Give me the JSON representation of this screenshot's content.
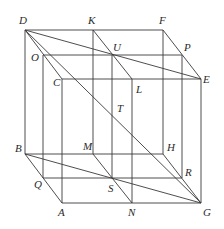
{
  "diagram": {
    "stroke_color": "#3a3a3a",
    "points": {
      "D": [
        25,
        30
      ],
      "K": [
        93,
        30
      ],
      "F": [
        163,
        30
      ],
      "O": [
        43,
        55
      ],
      "U": [
        112,
        55
      ],
      "P": [
        182,
        55
      ],
      "C": [
        62,
        79
      ],
      "L": [
        132,
        79
      ],
      "E": [
        201,
        79
      ],
      "B": [
        25,
        154
      ],
      "M": [
        93,
        154
      ],
      "H": [
        163,
        154
      ],
      "Q": [
        43,
        178
      ],
      "S": [
        112,
        178
      ],
      "R": [
        182,
        178
      ],
      "A": [
        62,
        203
      ],
      "N": [
        132,
        203
      ],
      "G": [
        201,
        203
      ],
      "T": [
        112,
        115
      ]
    },
    "segments": [
      [
        "D",
        "F"
      ],
      [
        "O",
        "P"
      ],
      [
        "C",
        "E"
      ],
      [
        "B",
        "H"
      ],
      [
        "Q",
        "R"
      ],
      [
        "A",
        "G"
      ],
      [
        "D",
        "B"
      ],
      [
        "K",
        "M"
      ],
      [
        "F",
        "H"
      ],
      [
        "O",
        "Q"
      ],
      [
        "U",
        "S"
      ],
      [
        "P",
        "R"
      ],
      [
        "C",
        "A"
      ],
      [
        "L",
        "N"
      ],
      [
        "E",
        "G"
      ],
      [
        "D",
        "C"
      ],
      [
        "K",
        "L"
      ],
      [
        "F",
        "E"
      ],
      [
        "B",
        "A"
      ],
      [
        "M",
        "N"
      ],
      [
        "H",
        "G"
      ],
      [
        "D",
        "E"
      ],
      [
        "D",
        "G"
      ],
      [
        "B",
        "G"
      ]
    ],
    "labels": [
      {
        "text": "D",
        "x": 19,
        "y": 24
      },
      {
        "text": "K",
        "x": 88,
        "y": 24
      },
      {
        "text": "F",
        "x": 159,
        "y": 24
      },
      {
        "text": "O",
        "x": 31,
        "y": 61
      },
      {
        "text": "U",
        "x": 113,
        "y": 51
      },
      {
        "text": "P",
        "x": 184,
        "y": 51
      },
      {
        "text": "C",
        "x": 53,
        "y": 86
      },
      {
        "text": "L",
        "x": 136,
        "y": 93
      },
      {
        "text": "E",
        "x": 203,
        "y": 83
      },
      {
        "text": "T",
        "x": 117,
        "y": 112
      },
      {
        "text": "B",
        "x": 15,
        "y": 152
      },
      {
        "text": "M",
        "x": 83,
        "y": 150
      },
      {
        "text": "H",
        "x": 167,
        "y": 151
      },
      {
        "text": "Q",
        "x": 34,
        "y": 188
      },
      {
        "text": "S",
        "x": 108,
        "y": 192
      },
      {
        "text": "R",
        "x": 185,
        "y": 176
      },
      {
        "text": "A",
        "x": 58,
        "y": 216
      },
      {
        "text": "N",
        "x": 128,
        "y": 216
      },
      {
        "text": "G",
        "x": 203,
        "y": 216
      }
    ]
  }
}
